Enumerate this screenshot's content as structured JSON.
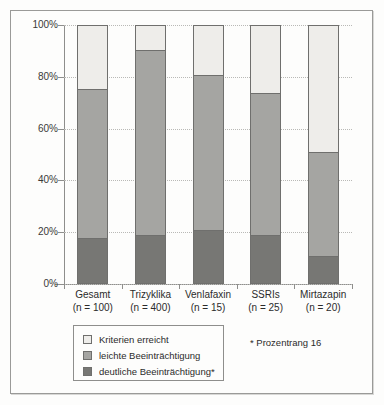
{
  "chart_data": {
    "type": "bar",
    "subtype": "stacked-100-percent",
    "title": "",
    "xlabel": "",
    "ylabel": "",
    "ylim": [
      0,
      100
    ],
    "ytick_labels": [
      "0%",
      "20%",
      "40%",
      "60%",
      "80%",
      "100%"
    ],
    "ytick_values": [
      0,
      20,
      40,
      60,
      80,
      100
    ],
    "grid": true,
    "grid_axis": "y",
    "grid_style": "dotted",
    "legend_position": "bottom-left",
    "categories": [
      "Gesamt",
      "Trizyklika",
      "Venlafaxin",
      "SSRIs",
      "Mirtazapin"
    ],
    "category_sublabels": [
      "(n = 100)",
      "(n = 400)",
      "(n = 15)",
      "(n = 25)",
      "(n = 20)"
    ],
    "category_n": [
      100,
      400,
      15,
      25,
      20
    ],
    "series": [
      {
        "name": "deutliche Beeinträchtigung*",
        "color": "#777774",
        "values": [
          17.5,
          18.5,
          20.5,
          18.5,
          10.5
        ]
      },
      {
        "name": "leichte Beeinträchtigung",
        "color": "#a5a5a2",
        "values": [
          57.5,
          71.5,
          60.0,
          55.0,
          40.0
        ]
      },
      {
        "name": "Kriterien erreicht",
        "color": "#eeedea",
        "values": [
          25.0,
          10.0,
          19.5,
          26.5,
          49.5
        ]
      }
    ],
    "cumulative_boundaries": {
      "dark_top": [
        17.5,
        18.5,
        20.5,
        18.5,
        10.5
      ],
      "mid_top": [
        75.0,
        90.0,
        80.5,
        73.5,
        50.5
      ]
    },
    "annotations": [
      "* Prozentrang 16"
    ]
  },
  "legend": {
    "items": [
      {
        "label": "Kriterien erreicht",
        "color": "#eeedea"
      },
      {
        "label": "leichte Beeinträchtigung",
        "color": "#a5a5a2"
      },
      {
        "label": "deutliche Beeinträchtigung*",
        "color": "#777774"
      }
    ]
  },
  "footnote": {
    "text": "* Prozentrang 16"
  },
  "colors": {
    "light": "#eeedea",
    "mid": "#a5a5a2",
    "dark": "#777774",
    "axis": "#8e8e8c",
    "grid": "#b9b9b6",
    "frame": "#9a9a98",
    "background": "#fdfdfc",
    "text": "#2b2b2b"
  }
}
